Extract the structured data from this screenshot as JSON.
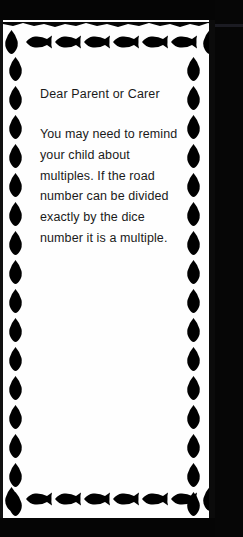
{
  "page": {
    "kind": "scanned-worksheet-note",
    "paper_color": "#fefefe",
    "ink_color": "#1a1a1a",
    "scan_band_color": "#050505"
  },
  "letter": {
    "greeting": "Dear Parent or Carer",
    "paragraph": "You may need to remind your child about multiples. If the road number can be divided exactly by the dice number it is a multiple.",
    "lines": [
      "You may need to",
      "remind your child",
      "about multiples. If the",
      "road number can be",
      "divided exactly by the",
      "dice number it is a",
      "multiple."
    ]
  },
  "border": {
    "motif": "fish-silhouette",
    "color": "#000000",
    "top_row_count": 6,
    "bottom_row_count": 6,
    "left_column_count": 19,
    "right_column_count": 19,
    "horizontal_fish_direction": "left",
    "vertical_fish_direction": "up",
    "corner_icon": "fish-vertical-icon"
  }
}
